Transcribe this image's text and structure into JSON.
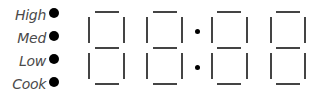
{
  "heat_levels": [
    {
      "label": "High",
      "indicator": "on"
    },
    {
      "label": "Med",
      "indicator": "on"
    },
    {
      "label": "Low",
      "indicator": "on"
    },
    {
      "label": "Cook",
      "indicator": "on"
    }
  ],
  "display": {
    "digits": [
      "8",
      "8",
      "8",
      "8"
    ],
    "separator": ":",
    "segment_color": "#444444",
    "indicator_color": "#000000"
  }
}
